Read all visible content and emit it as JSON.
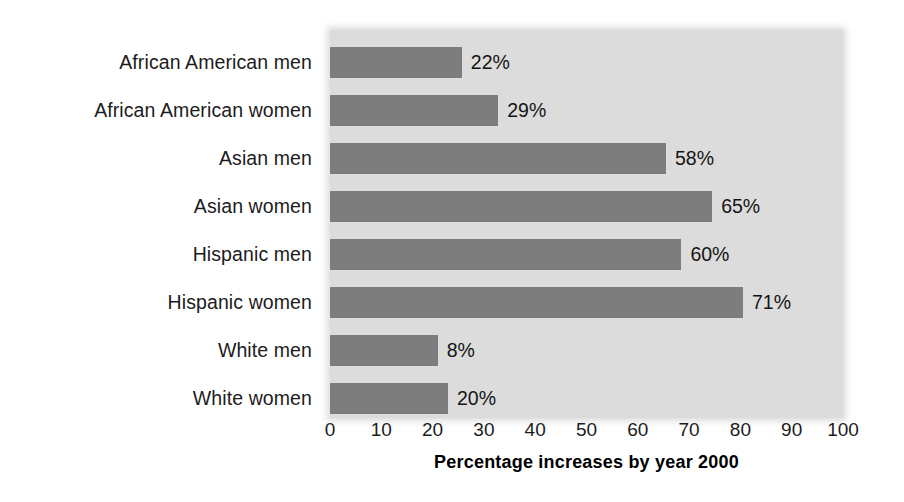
{
  "chart_data": {
    "type": "bar",
    "orientation": "horizontal",
    "title": "",
    "subtitle": "",
    "xlabel": "Percentage increases by year 2000",
    "ylabel": "",
    "xlim": [
      0,
      100
    ],
    "xticks": [
      0,
      10,
      20,
      30,
      40,
      50,
      60,
      70,
      80,
      90,
      100
    ],
    "xtick_labels": [
      "0",
      "10",
      "20",
      "30",
      "40",
      "50",
      "60",
      "70",
      "80",
      "90",
      "100"
    ],
    "grid": false,
    "legend": null,
    "categories": [
      "African American men",
      "African American women",
      "Asian men",
      "Asian women",
      "Hispanic men",
      "Hispanic women",
      "White men",
      "White women"
    ],
    "values": [
      22,
      29,
      58,
      65,
      60,
      71,
      8,
      20
    ],
    "value_labels": [
      "22%",
      "29%",
      "58%",
      "65%",
      "60%",
      "71%",
      "8%",
      "20%"
    ],
    "drawn_bar_lengths": [
      25.7,
      32.8,
      65.5,
      74.5,
      68.5,
      80.5,
      21.0,
      23.0
    ],
    "colors": {
      "bar_fill": "#7d7d7d",
      "plot_background": "#dcdcdc",
      "page_background": "#ffffff",
      "text": "#1c1c1c"
    }
  }
}
